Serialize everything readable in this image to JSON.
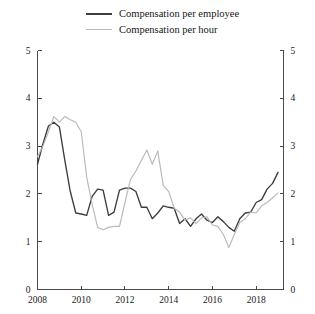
{
  "legend": {
    "position": "top-center",
    "entries": [
      {
        "label": "Compensation per employee",
        "color": "#3c3c41",
        "width": 2.0
      },
      {
        "label": "Compensation per hour",
        "color": "#b9b9bc",
        "width": 1.4
      }
    ]
  },
  "axes": {
    "y_left_ticks": [
      "0",
      "1",
      "2",
      "3",
      "4",
      "5"
    ],
    "y_right_ticks": [
      "0",
      "1",
      "2",
      "3",
      "4",
      "5"
    ],
    "x_ticks": [
      "2008",
      "2010",
      "2012",
      "2014",
      "2016",
      "2018"
    ]
  },
  "chart_data": {
    "type": "line",
    "title": "",
    "subtitle": "",
    "xlabel": "",
    "ylabel": "",
    "xlim": [
      2008.0,
      2019.25
    ],
    "ylim": [
      0,
      5
    ],
    "yticks": [
      0,
      1,
      2,
      3,
      4,
      5
    ],
    "xticks": [
      2008,
      2010,
      2012,
      2014,
      2016,
      2018
    ],
    "grid": false,
    "legend_position": "top-center",
    "x": [
      2008.0,
      2008.25,
      2008.5,
      2008.75,
      2009.0,
      2009.25,
      2009.5,
      2009.75,
      2010.0,
      2010.25,
      2010.5,
      2010.75,
      2011.0,
      2011.25,
      2011.5,
      2011.75,
      2012.0,
      2012.25,
      2012.5,
      2012.75,
      2013.0,
      2013.25,
      2013.5,
      2013.75,
      2014.0,
      2014.25,
      2014.5,
      2014.75,
      2015.0,
      2015.25,
      2015.5,
      2015.75,
      2016.0,
      2016.25,
      2016.5,
      2016.75,
      2017.0,
      2017.25,
      2017.5,
      2017.75,
      2018.0,
      2018.25,
      2018.5,
      2018.75,
      2019.0
    ],
    "series": [
      {
        "name": "Compensation per employee",
        "color": "#3c3c41",
        "values": [
          2.62,
          3.05,
          3.42,
          3.5,
          3.4,
          2.7,
          2.05,
          1.6,
          1.58,
          1.55,
          1.95,
          2.1,
          2.08,
          1.55,
          1.62,
          2.08,
          2.12,
          2.12,
          2.05,
          1.72,
          1.72,
          1.48,
          1.6,
          1.75,
          1.72,
          1.7,
          1.38,
          1.48,
          1.32,
          1.48,
          1.58,
          1.45,
          1.4,
          1.52,
          1.42,
          1.3,
          1.22,
          1.48,
          1.6,
          1.62,
          1.82,
          1.88,
          2.1,
          2.22,
          2.45
        ]
      },
      {
        "name": "Compensation per hour",
        "color": "#b9b9bc",
        "values": [
          2.78,
          3.0,
          3.3,
          3.62,
          3.5,
          3.62,
          3.55,
          3.5,
          3.3,
          2.35,
          1.78,
          1.3,
          1.25,
          1.3,
          1.32,
          1.32,
          1.82,
          2.3,
          2.48,
          2.7,
          2.92,
          2.62,
          2.9,
          2.18,
          2.05,
          1.7,
          1.62,
          1.45,
          1.5,
          1.38,
          1.5,
          1.52,
          1.35,
          1.32,
          1.15,
          0.88,
          1.15,
          1.4,
          1.48,
          1.62,
          1.6,
          1.75,
          1.82,
          1.92,
          2.02
        ]
      }
    ]
  }
}
